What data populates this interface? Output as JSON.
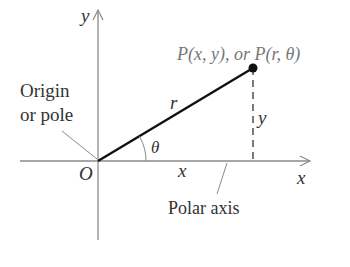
{
  "diagram": {
    "type": "polar-coordinates",
    "axes": {
      "x_label": "x",
      "y_label": "y"
    },
    "origin_label": "O",
    "origin_callout": [
      "Origin",
      "or pole"
    ],
    "polar_axis_label": "Polar axis",
    "point_label": "P(x, y), or P(r, θ)",
    "radius_label": "r",
    "angle_label": "θ",
    "x_segment_label": "x",
    "y_segment_label": "y"
  }
}
